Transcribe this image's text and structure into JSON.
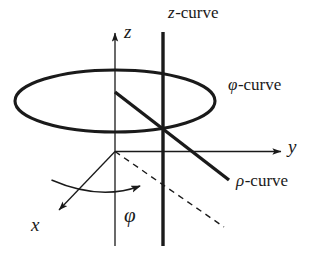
{
  "figure": {
    "background_color": "#ffffff",
    "stroke_color": "#1a1a1a",
    "axis_labels": {
      "x": "x",
      "y": "y",
      "z": "z"
    },
    "angle_label": "φ",
    "curve_labels": {
      "z_curve": {
        "symbol": "z",
        "suffix": "-curve",
        "full": "z-curve"
      },
      "phi_curve": {
        "symbol": "φ",
        "suffix": "-curve",
        "full": "φ-curve"
      },
      "rho_curve": {
        "symbol": "ρ",
        "suffix": "-curve",
        "full": "ρ-curve"
      }
    },
    "elements": [
      "z-axis-arrow",
      "y-axis-arrow",
      "x-axis-arrow",
      "phi-curve-ellipse",
      "z-curve-vertical-line",
      "rho-curve-thick-line",
      "phi-angle-arc",
      "projection-dashed-line"
    ]
  }
}
